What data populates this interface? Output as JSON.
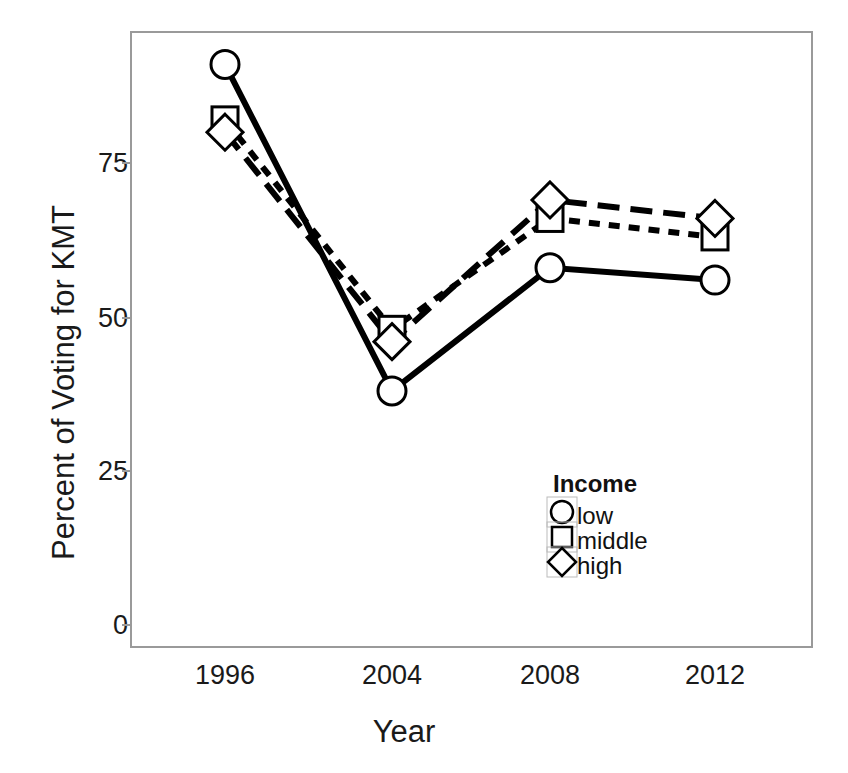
{
  "chart_data": {
    "type": "line",
    "title": "",
    "xlabel": "Year",
    "ylabel": "Percent of Voting for KMT",
    "categories": [
      "1996",
      "2004",
      "2008",
      "2012"
    ],
    "yticks": [
      0,
      25,
      50,
      75
    ],
    "ytick_labels": [
      "0",
      "25",
      "50",
      "75"
    ],
    "ylim": [
      0,
      101
    ],
    "grid": false,
    "legend_title": "Income",
    "legend_position": "inside-bottom-right",
    "series": [
      {
        "name": "low",
        "marker": "circle",
        "linestyle": "solid",
        "color": "#000000",
        "values": [
          91,
          38,
          58,
          56
        ]
      },
      {
        "name": "middle",
        "marker": "square",
        "linestyle": "short-dash",
        "color": "#000000",
        "values": [
          82,
          48,
          66,
          63
        ]
      },
      {
        "name": "high",
        "marker": "diamond",
        "linestyle": "long-dash",
        "color": "#000000",
        "values": [
          80,
          46,
          69,
          66
        ]
      }
    ]
  },
  "axes": {
    "y_title": "Percent of Voting for KMT",
    "x_title": "Year",
    "y_tick_labels": [
      "75",
      "50",
      "25",
      "0"
    ],
    "x_tick_labels": [
      "1996",
      "2004",
      "2008",
      "2012"
    ]
  },
  "legend": {
    "title": "Income",
    "items": [
      {
        "label": "low",
        "marker": "circle-icon"
      },
      {
        "label": "middle",
        "marker": "square-icon"
      },
      {
        "label": "high",
        "marker": "diamond-icon"
      }
    ]
  },
  "style": {
    "frame_color": "#9a9a9a",
    "ink_color": "#000000",
    "background": "#ffffff"
  }
}
